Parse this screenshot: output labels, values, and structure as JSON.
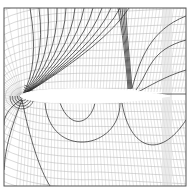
{
  "figure": {
    "colors": {
      "background": "#ffffff",
      "grid": "#9a9a9a",
      "contour": "#1e1e1e",
      "airfoil": "#ffffff",
      "frame": "#555555"
    },
    "frame": {
      "x": 4,
      "y": 8,
      "w": 182,
      "h": 178
    },
    "airfoil": {
      "le_x": 22,
      "te_x": 166,
      "chord_y": 96,
      "thickness": 11
    },
    "shock_x": 132
  }
}
